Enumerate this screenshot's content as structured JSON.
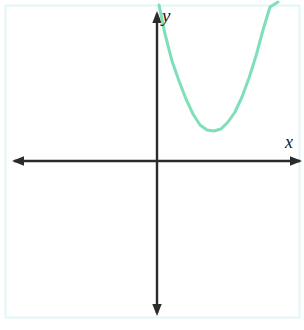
{
  "figure": {
    "title": "",
    "background_color": "#ffffff",
    "border_color": "#e2f6f7",
    "width": 304,
    "height": 330
  },
  "axes": {
    "x_label": "x",
    "y_label": "y",
    "axis_color": "#2b2b2b",
    "origin": {
      "x": 157,
      "y": 161
    },
    "x_axis": {
      "start_x": 12,
      "end_x": 302,
      "y": 161,
      "arrows": "both"
    },
    "y_axis": {
      "x": 157,
      "start_y": 12,
      "end_y": 315,
      "arrows": "both"
    },
    "tick_labels_x": [],
    "tick_labels_y": []
  },
  "chart_data": {
    "type": "line",
    "title": "",
    "xlabel": "x",
    "ylabel": "y",
    "grid": false,
    "legend": null,
    "xlim": [
      -2.9,
      3.0
    ],
    "ylim": [
      -3.1,
      3.1
    ],
    "series": [
      {
        "name": "parabola",
        "color": "#7fdfb8",
        "line_width": 3,
        "shape": "upward-opening parabola",
        "vertex": {
          "x": 1.15,
          "y": 0.6
        },
        "description": "Upward opening parabola lying entirely in the first quadrant, above the x-axis and to the right of the y-axis; both branches exit the top edge of the frame.",
        "x": [
          0.02,
          0.14,
          0.29,
          0.43,
          0.58,
          0.72,
          0.87,
          1.01,
          1.15,
          1.3,
          1.44,
          1.59,
          1.73,
          1.88,
          2.02,
          2.17,
          2.31,
          2.46
        ],
        "y": [
          3.1,
          2.53,
          2.0,
          1.6,
          1.25,
          0.95,
          0.74,
          0.63,
          0.6,
          0.64,
          0.77,
          0.98,
          1.27,
          1.64,
          2.08,
          2.6,
          3.05,
          3.15
        ],
        "pixel_points": [
          [
            159,
            5
          ],
          [
            165,
            34
          ],
          [
            172,
            61
          ],
          [
            179,
            81
          ],
          [
            186,
            99
          ],
          [
            193,
            114
          ],
          [
            200,
            125
          ],
          [
            207,
            130
          ],
          [
            214,
            131
          ],
          [
            221,
            129
          ],
          [
            228,
            122
          ],
          [
            235,
            112
          ],
          [
            242,
            97
          ],
          [
            249,
            78
          ],
          [
            256,
            56
          ],
          [
            263,
            30
          ],
          [
            270,
            7
          ],
          [
            278,
            2
          ]
        ]
      }
    ]
  }
}
